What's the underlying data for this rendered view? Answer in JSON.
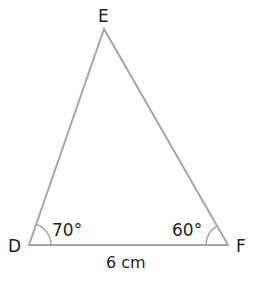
{
  "diagram": {
    "type": "triangle",
    "vertices": {
      "D": {
        "label": "D",
        "x": 29,
        "y": 245
      },
      "E": {
        "label": "E",
        "x": 104,
        "y": 29
      },
      "F": {
        "label": "F",
        "x": 228,
        "y": 245
      }
    },
    "angles": {
      "D": {
        "label": "70°"
      },
      "F": {
        "label": "60°"
      }
    },
    "sides": {
      "DF": {
        "label": "6 cm"
      }
    },
    "colors": {
      "line": "#a6a6a6",
      "text": "#222222"
    }
  }
}
